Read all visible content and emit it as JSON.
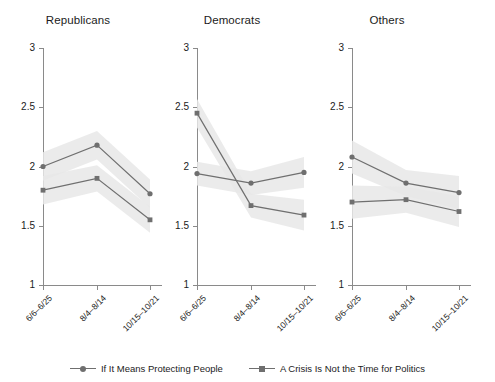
{
  "chart_data": {
    "type": "line",
    "title": "",
    "xlabel": "",
    "ylabel": "",
    "ylim": [
      1,
      3
    ],
    "yticks": [
      "1",
      "1.5",
      "2",
      "2.5",
      "3"
    ],
    "ytick_values": [
      1,
      1.5,
      2,
      2.5,
      3
    ],
    "grid": false,
    "legend_position": "bottom",
    "x": [
      "6/6–6/25",
      "8/4–8/14",
      "10/15–10/21"
    ],
    "panels": [
      {
        "title": "Republicans",
        "series": [
          {
            "name": "If It Means Protecting People",
            "marker": "circle",
            "values": [
              2.0,
              2.18,
              1.77
            ],
            "ci_low": [
              1.88,
              2.06,
              1.65
            ],
            "ci_high": [
              2.12,
              2.3,
              1.89
            ]
          },
          {
            "name": "A Crisis Is Not the Time for Politics",
            "marker": "square",
            "values": [
              1.8,
              1.9,
              1.55
            ],
            "ci_low": [
              1.68,
              1.79,
              1.44
            ],
            "ci_high": [
              1.92,
              2.01,
              1.66
            ]
          }
        ]
      },
      {
        "title": "Democrats",
        "series": [
          {
            "name": "If It Means Protecting People",
            "marker": "circle",
            "values": [
              1.94,
              1.86,
              1.95
            ],
            "ci_low": [
              1.84,
              1.76,
              1.82
            ],
            "ci_high": [
              2.04,
              1.96,
              2.08
            ]
          },
          {
            "name": "A Crisis Is Not the Time for Politics",
            "marker": "square",
            "values": [
              2.45,
              1.67,
              1.59
            ],
            "ci_low": [
              2.33,
              1.57,
              1.46
            ],
            "ci_high": [
              2.57,
              1.77,
              1.72
            ]
          }
        ]
      },
      {
        "title": "Others",
        "series": [
          {
            "name": "If It Means Protecting People",
            "marker": "circle",
            "values": [
              2.08,
              1.86,
              1.78
            ],
            "ci_low": [
              1.94,
              1.75,
              1.64
            ],
            "ci_high": [
              2.22,
              1.97,
              1.92
            ]
          },
          {
            "name": "A Crisis Is Not the Time for Politics",
            "marker": "square",
            "values": [
              1.7,
              1.72,
              1.62
            ],
            "ci_low": [
              1.56,
              1.61,
              1.49
            ],
            "ci_high": [
              1.84,
              1.83,
              1.75
            ]
          }
        ]
      }
    ],
    "legend": [
      {
        "label": "If It Means Protecting People",
        "marker": "circle"
      },
      {
        "label": "A Crisis Is Not the Time for Politics",
        "marker": "square"
      }
    ],
    "colors": {
      "line": "#6f6f6f",
      "marker": "#6f6f6f",
      "band": "#e8e8e8",
      "axis": "#8a8a8a",
      "text": "#1b1b1b"
    }
  }
}
